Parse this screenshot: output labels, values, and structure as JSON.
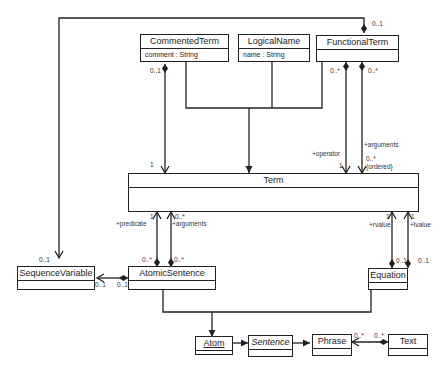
{
  "classes": {
    "commented_term": {
      "name": "CommentedTerm",
      "attribute": "comment : String"
    },
    "logical_name": {
      "name": "LogicalName",
      "attribute": "name : String"
    },
    "functional_term": {
      "name": "FunctionalTerm"
    },
    "term": {
      "name": "Term"
    },
    "sequence_variable": {
      "name": "SequenceVariable"
    },
    "atomic_sentence": {
      "name": "AtomicSentence"
    },
    "equation": {
      "name": "Equation"
    },
    "atom": {
      "name": "Atom"
    },
    "sentence": {
      "name": "Sentence"
    },
    "phrase": {
      "name": "Phrase"
    },
    "text": {
      "name": "Text"
    }
  },
  "labels": {
    "ft_seqvar_mult": "0..1",
    "ct_mult_source": "0..1",
    "ct_term_mult": "1",
    "ft_op_source": "0..*",
    "ft_args_source": "0..*",
    "operator_role": "+operator",
    "operator_mult": "1",
    "arguments_role": "+arguments",
    "arguments_mult": "0..*",
    "arguments_ordered": "{ordered}",
    "predicate_role": "+predicate",
    "predicate_mult": "1",
    "as_args_mult": "0..*",
    "as_args_role": "+arguments",
    "as_pred_source": "0..*",
    "as_args_source": "0..*",
    "seqvar_top_mult": "0..1",
    "seqvar_mult": "0..1",
    "as_seqvar_source": "0..1",
    "rvalue_mult": "1",
    "rvalue_role": "+rvalue",
    "lvalue_mult": "1",
    "lvalue_role": "+lvalue",
    "eq_r_source": "0..1",
    "eq_l_source": "0..1",
    "phrase_mult": "0..*",
    "text_mult": "0..*"
  }
}
